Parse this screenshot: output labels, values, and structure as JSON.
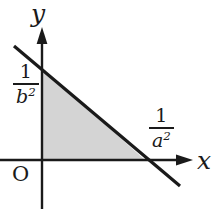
{
  "figure": {
    "background_color": "#ffffff",
    "stroke_color": "#1a1a1a",
    "fill_color": "#d4d4d4",
    "width": 220,
    "height": 209
  },
  "axes": {
    "x_axis": {
      "label": "x",
      "arrow": "right-arrow-icon",
      "origin_px": 42,
      "y_px": 160,
      "start_px": 0,
      "end_px": 192
    },
    "y_axis": {
      "label": "y",
      "arrow": "up-arrow-icon",
      "x_px": 42,
      "top_px": 28,
      "bottom_px": 209
    },
    "origin_label": "O"
  },
  "labels": {
    "y_intercept": {
      "numerator": "1",
      "denominator_base": "b",
      "denominator_exponent": "2",
      "text": "1/b^2"
    },
    "x_intercept": {
      "numerator": "1",
      "denominator_base": "a",
      "denominator_exponent": "2",
      "text": "1/a^2"
    }
  },
  "line": {
    "name": "boundary-line",
    "from_px": [
      14,
      46
    ],
    "to_px": [
      180,
      186
    ],
    "y_intercept_px": [
      42,
      68
    ],
    "x_intercept_px": [
      145,
      160
    ],
    "stroke_width": 3
  },
  "region": {
    "name": "shaded-triangle",
    "vertices_px": [
      [
        42,
        68
      ],
      [
        42,
        160
      ],
      [
        145,
        160
      ]
    ],
    "fill": "#d4d4d4"
  }
}
